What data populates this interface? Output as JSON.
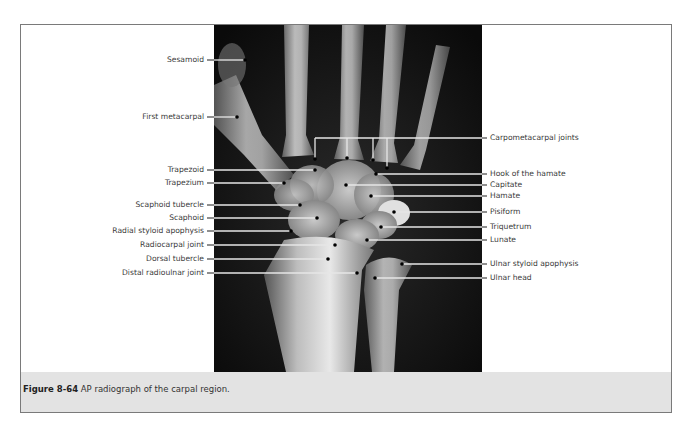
{
  "figure": {
    "number": "Figure 8-64",
    "caption": "AP radiograph of the carpal region.",
    "image_description": "AP wrist x-ray"
  },
  "labels_left": [
    {
      "text": "Sesamoid",
      "y": 60,
      "dot_x": 245
    },
    {
      "text": "First metacarpal",
      "y": 117,
      "dot_x": 237
    },
    {
      "text": "Trapezoid",
      "y": 170,
      "dot_x": 315
    },
    {
      "text": "Trapezium",
      "y": 183,
      "dot_x": 284
    },
    {
      "text": "Scaphoid tubercle",
      "y": 205,
      "dot_x": 300
    },
    {
      "text": "Scaphoid",
      "y": 218,
      "dot_x": 317
    },
    {
      "text": "Radial styloid apophysis",
      "y": 231,
      "dot_x": 291
    },
    {
      "text": "Radiocarpal joint",
      "y": 245,
      "dot_x": 335
    },
    {
      "text": "Dorsal tubercle",
      "y": 259,
      "dot_x": 328
    },
    {
      "text": "Distal radioulnar joint",
      "y": 273,
      "dot_x": 357
    }
  ],
  "labels_right": [
    {
      "text": "Carpometacarpal joints",
      "y": 138,
      "dot_x": null
    },
    {
      "text": "Hook of the hamate",
      "y": 174,
      "dot_x": 376
    },
    {
      "text": "Capitate",
      "y": 185,
      "dot_x": 346
    },
    {
      "text": "Hamate",
      "y": 196,
      "dot_x": 371
    },
    {
      "text": "Pisiform",
      "y": 212,
      "dot_x": 394
    },
    {
      "text": "Triquetrum",
      "y": 227,
      "dot_x": 381
    },
    {
      "text": "Lunate",
      "y": 240,
      "dot_x": 367
    },
    {
      "text": "Ulnar styloid apophysis",
      "y": 264,
      "dot_x": 402
    },
    {
      "text": "Ulnar head",
      "y": 278,
      "dot_x": 375
    }
  ],
  "cmc_bracket_dots": [
    {
      "x": 315,
      "y": 159
    },
    {
      "x": 347,
      "y": 158
    },
    {
      "x": 373,
      "y": 160
    },
    {
      "x": 387,
      "y": 168
    }
  ],
  "colors": {
    "frame_border": "#7a7a7a",
    "caption_band": "#e3e3e3",
    "leader_line": "#e8e8e8",
    "label_text": "#3a3a3a"
  }
}
